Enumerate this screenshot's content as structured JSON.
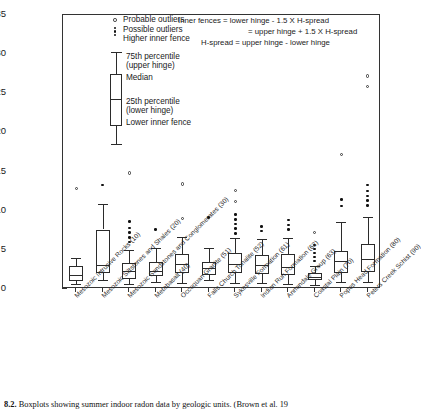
{
  "figure": {
    "caption_number": "8.2.",
    "caption_text": "Boxplots showing summer indoor radon data by geologic units. (Brown et al. 19"
  },
  "legend": {
    "items": [
      {
        "symbol": "open-circle",
        "label": "Probable outliers"
      },
      {
        "symbol": "stacked-dots",
        "label": "Possible outliers"
      },
      {
        "symbol": "whisker-cap",
        "label": "Higher inner fence"
      }
    ],
    "annotations": [
      {
        "name": "upper-hinge",
        "line1": "75th percentile",
        "line2": "(upper hinge)"
      },
      {
        "name": "median",
        "line1": "Median",
        "line2": ""
      },
      {
        "name": "lower-hinge",
        "line1": "25th percentile",
        "line2": "(lower hinge)"
      },
      {
        "name": "lower-fence",
        "line1": "Lower inner fence",
        "line2": ""
      }
    ],
    "formulas": [
      "Inner fences = lower hinge - 1.5 X H-spread",
      "= upper hinge + 1.5 X H-spread",
      "H-spread = upper hinge - lower hinge"
    ]
  },
  "chart_data": {
    "type": "box",
    "title": "",
    "xlabel": "",
    "ylabel": "Indoor radon concentration (picocuries l",
    "ylabel_exponent": "-1",
    "ylabel_close": ")",
    "ylim": [
      0,
      35
    ],
    "yticks": [
      0,
      5,
      10,
      15,
      20,
      25,
      30,
      35
    ],
    "grid": false,
    "legend_position": "inside-top-left",
    "categories": [
      "Mesozoic Intrusive Rocks (10)",
      "Mesozoic Siltstones and Shales (20)",
      "Mesozoic Sandstones and Conglomerates (30)",
      "Metabasalt (40)",
      "Occoquan Granite (51)",
      "Falls Church Tonalite (52)",
      "Sykesville Formation (61)",
      "Indian Run Formation (62)",
      "Annandale Group (63)",
      "Coastal Plain (70)",
      "Popes Head Formation (80)",
      "Peters Creek Schist (90)"
    ],
    "unit_codes": [
      10,
      20,
      30,
      40,
      51,
      52,
      61,
      62,
      63,
      70,
      80,
      90
    ],
    "boxes": [
      {
        "category": "Mesozoic Intrusive Rocks (10)",
        "lower_fence": 0.6,
        "q1": 1.0,
        "median": 1.8,
        "q3": 2.9,
        "upper_fence": 4.0,
        "possible_outliers": [],
        "probable_outliers": [
          12.8
        ]
      },
      {
        "category": "Mesozoic Siltstones and Shales (20)",
        "lower_fence": 1.2,
        "q1": 2.1,
        "median": 3.1,
        "q3": 7.6,
        "upper_fence": 10.8,
        "possible_outliers": [
          13.3
        ],
        "probable_outliers": []
      },
      {
        "category": "Mesozoic Sandstones and Conglomerates (30)",
        "lower_fence": 0.6,
        "q1": 1.3,
        "median": 2.3,
        "q3": 3.3,
        "upper_fence": 5.0,
        "possible_outliers": [
          6.0,
          6.6,
          7.2,
          7.8,
          8.6
        ],
        "probable_outliers": [
          14.8
        ]
      },
      {
        "category": "Metabasalt (40)",
        "lower_fence": 0.9,
        "q1": 1.6,
        "median": 2.3,
        "q3": 3.4,
        "upper_fence": 5.3,
        "possible_outliers": [
          7.6
        ],
        "probable_outliers": []
      },
      {
        "category": "Occoquan Granite (51)",
        "lower_fence": 0.8,
        "q1": 2.0,
        "median": 3.2,
        "q3": 4.5,
        "upper_fence": 6.6,
        "possible_outliers": [],
        "probable_outliers": [
          9.0,
          13.4
        ]
      },
      {
        "category": "Falls Church Tonalite (52)",
        "lower_fence": 1.1,
        "q1": 1.8,
        "median": 2.7,
        "q3": 3.5,
        "upper_fence": 5.2,
        "possible_outliers": [
          9.1
        ],
        "probable_outliers": []
      },
      {
        "category": "Sykesville Formation (61)",
        "lower_fence": 0.8,
        "q1": 2.0,
        "median": 3.2,
        "q3": 4.6,
        "upper_fence": 6.5,
        "possible_outliers": [
          7.1,
          7.7,
          8.3,
          8.9,
          9.5
        ],
        "probable_outliers": [
          11.2,
          12.6
        ]
      },
      {
        "category": "Indian Run Formation (62)",
        "lower_fence": 0.8,
        "q1": 1.9,
        "median": 3.1,
        "q3": 4.4,
        "upper_fence": 6.4,
        "possible_outliers": [
          7.4,
          8.0
        ],
        "probable_outliers": []
      },
      {
        "category": "Annandale Group (63)",
        "lower_fence": 0.7,
        "q1": 1.8,
        "median": 2.8,
        "q3": 4.5,
        "upper_fence": 6.5,
        "possible_outliers": [
          7.6,
          8.2,
          8.8
        ],
        "probable_outliers": []
      },
      {
        "category": "Coastal Plain (70)",
        "lower_fence": 0.5,
        "q1": 1.1,
        "median": 1.5,
        "q3": 2.0,
        "upper_fence": 3.0,
        "possible_outliers": [
          3.6,
          4.1,
          4.6,
          5.1,
          5.6
        ],
        "probable_outliers": [
          7.2
        ]
      },
      {
        "category": "Popes Head Formation (80)",
        "lower_fence": 0.9,
        "q1": 2.1,
        "median": 3.6,
        "q3": 4.9,
        "upper_fence": 8.6,
        "possible_outliers": [
          10.6,
          11.4
        ],
        "probable_outliers": [
          17.2
        ]
      },
      {
        "category": "Peters Creek Schist (90)",
        "lower_fence": 0.9,
        "q1": 2.2,
        "median": 3.8,
        "q3": 5.7,
        "upper_fence": 9.2,
        "possible_outliers": [
          10.7,
          11.3,
          11.9,
          12.5,
          13.3
        ],
        "probable_outliers": [
          25.9,
          27.2
        ]
      }
    ]
  }
}
